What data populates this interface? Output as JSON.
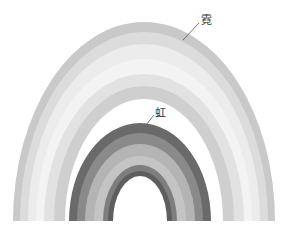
{
  "diagram": {
    "title": "",
    "labels": {
      "secondary_rainbow": "霓",
      "primary_rainbow": "虹"
    },
    "baseline_y": 221,
    "secondary_bow": {
      "bands": [
        {
          "name": "outer-band",
          "color": "#c9c9c9",
          "rx": 131,
          "ry": 199,
          "cx": 144
        },
        {
          "name": "band-2",
          "color": "#dcdcdc",
          "rx": 124,
          "ry": 189,
          "cx": 144
        },
        {
          "name": "band-3",
          "color": "#ececec",
          "rx": 116,
          "ry": 177,
          "cx": 144
        },
        {
          "name": "band-4",
          "color": "#f3f3f3",
          "rx": 108,
          "ry": 162,
          "cx": 144
        },
        {
          "name": "band-5",
          "color": "#e2e2e2",
          "rx": 100,
          "ry": 147,
          "cx": 144
        },
        {
          "name": "inner-band",
          "color": "#cfcfcf",
          "rx": 90,
          "ry": 135,
          "cx": 144
        }
      ],
      "inner_gap": {
        "rx": 79,
        "ry": 122,
        "cx": 144
      }
    },
    "primary_bow": {
      "bands": [
        {
          "name": "outer-band",
          "color": "#6a6a6a",
          "rx": 71,
          "ry": 98,
          "cx": 140
        },
        {
          "name": "band-2",
          "color": "#8a8a8a",
          "rx": 63,
          "ry": 88,
          "cx": 140
        },
        {
          "name": "band-3",
          "color": "#b4b4b4",
          "rx": 55,
          "ry": 77,
          "cx": 140
        },
        {
          "name": "band-4",
          "color": "#c4c4c4",
          "rx": 46,
          "ry": 65,
          "cx": 140
        },
        {
          "name": "band-5",
          "color": "#7e7e7e",
          "rx": 37,
          "ry": 56,
          "cx": 140
        },
        {
          "name": "inner-band",
          "color": "#5e5e5e",
          "rx": 32,
          "ry": 50,
          "cx": 140
        }
      ],
      "inner_gap": {
        "rx": 27,
        "ry": 45,
        "cx": 140
      }
    },
    "leader_lines": [
      {
        "name": "ni-leader",
        "x1": 183,
        "y1": 40,
        "x2": 199,
        "y2": 23
      },
      {
        "name": "hong-leader",
        "x1": 146,
        "y1": 125,
        "x2": 154,
        "y2": 115
      }
    ]
  }
}
